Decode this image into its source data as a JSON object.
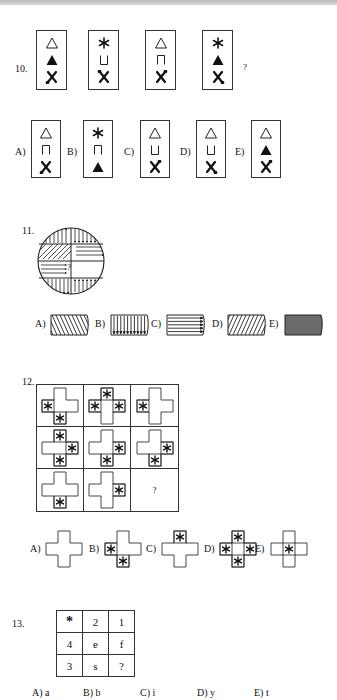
{
  "page": {
    "top_bar_color": "#c4c4c4"
  },
  "q10": {
    "number": "10.",
    "question_mark": "?",
    "sequence": [
      {
        "top": "△",
        "middle": "▲",
        "bottom": "X",
        "dot": "bottom-left"
      },
      {
        "top": "*",
        "middle": "⊔",
        "bottom": "X",
        "dot": "top-left"
      },
      {
        "top": "△",
        "middle": "⊓",
        "bottom": "X",
        "dot": "top-right"
      },
      {
        "top": "*",
        "middle": "▲",
        "bottom": "X",
        "dot": "bottom-right"
      }
    ],
    "options": [
      {
        "label": "A)",
        "top": "△",
        "middle": "⊓",
        "bottom": "X",
        "dot": "bottom-left"
      },
      {
        "label": "B)",
        "top": "*",
        "middle": "⊓",
        "bottom": "▲",
        "dot": "none"
      },
      {
        "label": "C)",
        "top": "△",
        "middle": "⊔",
        "bottom": "X",
        "dot": "top-right"
      },
      {
        "label": "D)",
        "top": "△",
        "middle": "⊔",
        "bottom": "X",
        "dot": "bottom-right"
      },
      {
        "label": "E)",
        "top": "△",
        "middle": "▲",
        "bottom": "X",
        "dot": "top-right"
      }
    ]
  },
  "q11": {
    "number": "11.",
    "question_mark": "?",
    "circle_sectors": [
      {
        "position": "top-left",
        "pattern": "vertical arrows up"
      },
      {
        "position": "top-right",
        "pattern": "vertical arrows down"
      },
      {
        "position": "mid-upper-left",
        "pattern": "diagonal hatch"
      },
      {
        "position": "mid-upper-right",
        "pattern": "horizontal arrows right"
      },
      {
        "position": "mid-lower-left",
        "pattern": "horizontal arrows right"
      },
      {
        "position": "mid-lower-right",
        "pattern": "unknown"
      },
      {
        "position": "bottom-left",
        "pattern": "vertical arrows down"
      },
      {
        "position": "bottom-right",
        "pattern": "vertical arrows up"
      }
    ],
    "options": [
      {
        "label": "A)",
        "pattern": "backslash hatch"
      },
      {
        "label": "B)",
        "pattern": "vertical arrows down"
      },
      {
        "label": "C)",
        "pattern": "horizontal arrows right"
      },
      {
        "label": "D)",
        "pattern": "forward-slash hatch"
      },
      {
        "label": "E)",
        "pattern": "solid gray",
        "color": "#6a6a6a"
      }
    ]
  },
  "q12": {
    "number": "12.",
    "question_mark": "?",
    "star": "*",
    "grid": [
      [
        [
          "left",
          "bottom"
        ],
        [
          "top",
          "left",
          "right"
        ],
        [
          "left"
        ]
      ],
      [
        [
          "top",
          "right",
          "bottom"
        ],
        [
          "right",
          "bottom"
        ],
        [
          "right",
          "bottom"
        ]
      ],
      [
        [
          "bottom"
        ],
        [
          "right"
        ],
        "?"
      ]
    ],
    "options": [
      {
        "label": "A)",
        "stars": []
      },
      {
        "label": "B)",
        "stars": [
          "left",
          "bottom"
        ]
      },
      {
        "label": "C)",
        "stars": [
          "top"
        ]
      },
      {
        "label": "D)",
        "stars": [
          "top",
          "left",
          "right",
          "bottom"
        ]
      },
      {
        "label": "E)",
        "stars": [
          "center"
        ]
      }
    ]
  },
  "q13": {
    "number": "13.",
    "grid": [
      [
        "*",
        "2",
        "1"
      ],
      [
        "4",
        "e",
        "f"
      ],
      [
        "3",
        "s",
        "?"
      ]
    ],
    "options": [
      "A) a",
      "B) b",
      "C) i",
      "D) y",
      "E) t"
    ]
  }
}
